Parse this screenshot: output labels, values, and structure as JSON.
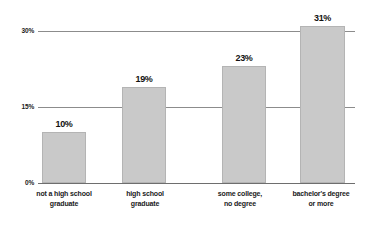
{
  "chart_data": {
    "type": "bar",
    "title": "",
    "subtitle": "",
    "xlabel": "",
    "ylabel": "",
    "categories": [
      "not a high school graduate",
      "high school graduate",
      "some college, no degree",
      "bachelor's degree or more"
    ],
    "category_lines": [
      [
        "not a high school",
        "graduate"
      ],
      [
        "high school",
        "graduate"
      ],
      [
        "some college,",
        "no degree"
      ],
      [
        "bachelor's degree",
        "or more"
      ]
    ],
    "values": [
      10,
      19,
      23,
      31
    ],
    "value_labels": [
      "10%",
      "19%",
      "23%",
      "31%"
    ],
    "ylim": [
      0,
      30
    ],
    "yticks": [
      0,
      15,
      30
    ],
    "ytick_labels": [
      "0%",
      "15%",
      "30%"
    ],
    "grid": true,
    "grid_axis": "y",
    "legend": false,
    "bar_color": "#c9c9c9",
    "bar_border_color": "#b4b4b4",
    "gridline_color": "#8c8c8c",
    "axis_color": "#6e6e6e",
    "text_color": "#1a1a1a",
    "background": "#ffffff"
  }
}
